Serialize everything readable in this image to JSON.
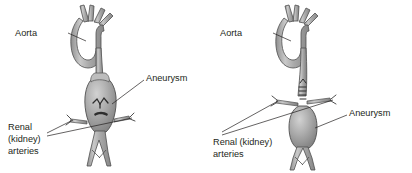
{
  "figure": {
    "background_color": "#ffffff",
    "ink_color": "#231f20",
    "vessel_fill": "#a8a8a8",
    "vessel_shade": "#8d8d8d",
    "vessel_highlight": "#cfcfcf",
    "vessel_outline": "#4f4f4f"
  },
  "panels": [
    {
      "id": "left-panel",
      "name": "suprarenal-aneurysm",
      "labels": {
        "aorta": "Aorta",
        "aneurysm": "Aneurysm",
        "renal_line1": "Renal",
        "renal_line2": "(kidney)",
        "renal_line3": "arteries"
      }
    },
    {
      "id": "right-panel",
      "name": "infrarenal-aneurysm",
      "labels": {
        "aorta": "Aorta",
        "aneurysm": "Aneurysm",
        "renal_line1": "Renal (kidney)",
        "renal_line2": "arteries"
      }
    }
  ]
}
